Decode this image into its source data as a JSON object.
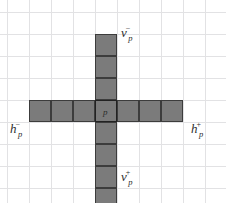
{
  "figure": {
    "type": "grid-cross-diagram",
    "background_color": "#ffffff",
    "grid_line_color": "#e2e2e4",
    "cell_fill_color": "#7b7b7b",
    "cell_border_color": "#3c3c3c",
    "label_color": "#2e2e2e",
    "grid": {
      "cell_size_px": 22,
      "columns": 10,
      "rows": 9
    },
    "center_cell": {
      "label": "p"
    },
    "labels": {
      "top": {
        "base": "v",
        "superscript": "−",
        "subscript": "p"
      },
      "bottom": {
        "base": "v",
        "superscript": "+",
        "subscript": "p"
      },
      "left": {
        "base": "h",
        "superscript": "−",
        "subscript": "p"
      },
      "right": {
        "base": "h",
        "superscript": "+",
        "subscript": "p"
      }
    },
    "arms": {
      "vertical_cells_above_center": 4,
      "vertical_cells_below_center": 4,
      "horizontal_cells_left_of_center": 3,
      "horizontal_cells_right_of_center": 3
    }
  }
}
